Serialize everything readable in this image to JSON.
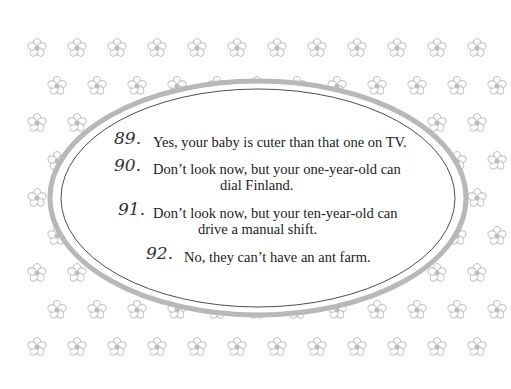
{
  "items": [
    {
      "number": "89.",
      "lines": [
        "Yes, your baby is cuter than that one on TV."
      ]
    },
    {
      "number": "90.",
      "lines": [
        "Don’t look now, but your one-year-old can",
        "dial Finland."
      ]
    },
    {
      "number": "91.",
      "lines": [
        "Don’t look now, but your ten-year-old can",
        "drive a manual shift."
      ]
    },
    {
      "number": "92.",
      "lines": [
        "No, they can’t have an ant farm."
      ]
    }
  ],
  "decoration": {
    "icon": "flower-icon",
    "frame": "oval-frame",
    "flower_color": "#bdbdbd",
    "frame_color": "#b5b5b5"
  }
}
